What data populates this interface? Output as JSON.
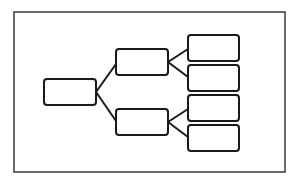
{
  "diagram": {
    "type": "tree",
    "canvas": {
      "width": 295,
      "height": 182,
      "background": "#ffffff"
    },
    "stroke_color": "#1a1a1a",
    "frame": {
      "x": 14,
      "y": 12,
      "width": 271,
      "height": 160,
      "stroke": "#3a3a3a",
      "stroke_width": 1.5
    },
    "box_style": {
      "rx": 3,
      "stroke_width": 2,
      "fill": "#ffffff"
    },
    "connector_style": {
      "stroke_width": 2
    },
    "nodes": [
      {
        "id": "root",
        "level": 0,
        "x": 44,
        "y": 79,
        "width": 52,
        "height": 26,
        "label": ""
      },
      {
        "id": "mid-1",
        "level": 1,
        "x": 116,
        "y": 49,
        "width": 52,
        "height": 26,
        "label": ""
      },
      {
        "id": "mid-2",
        "level": 1,
        "x": 116,
        "y": 109,
        "width": 52,
        "height": 26,
        "label": ""
      },
      {
        "id": "leaf-1",
        "level": 2,
        "x": 188,
        "y": 35,
        "width": 51,
        "height": 26,
        "label": ""
      },
      {
        "id": "leaf-2",
        "level": 2,
        "x": 188,
        "y": 65,
        "width": 51,
        "height": 26,
        "label": ""
      },
      {
        "id": "leaf-3",
        "level": 2,
        "x": 188,
        "y": 95,
        "width": 51,
        "height": 26,
        "label": ""
      },
      {
        "id": "leaf-4",
        "level": 2,
        "x": 188,
        "y": 125,
        "width": 51,
        "height": 26,
        "label": ""
      }
    ],
    "edges": [
      {
        "from": "root",
        "to": "mid-1",
        "x1": 96,
        "y1": 92,
        "x2": 116,
        "y2": 64
      },
      {
        "from": "root",
        "to": "mid-2",
        "x1": 96,
        "y1": 92,
        "x2": 116,
        "y2": 121
      },
      {
        "from": "mid-1",
        "to": "leaf-1",
        "x1": 168,
        "y1": 62,
        "x2": 188,
        "y2": 49
      },
      {
        "from": "mid-1",
        "to": "leaf-2",
        "x1": 168,
        "y1": 62,
        "x2": 188,
        "y2": 77
      },
      {
        "from": "mid-2",
        "to": "leaf-3",
        "x1": 168,
        "y1": 122,
        "x2": 188,
        "y2": 109
      },
      {
        "from": "mid-2",
        "to": "leaf-4",
        "x1": 168,
        "y1": 122,
        "x2": 188,
        "y2": 137
      }
    ]
  }
}
